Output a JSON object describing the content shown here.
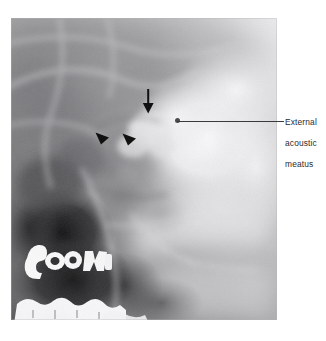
{
  "figure": {
    "type": "radiograph",
    "modality": "plain film radiograph of the skull (lateral oblique / temporal bone view)",
    "panel": {
      "name": "radiograph-image",
      "x": 11,
      "y": 18,
      "width": 266,
      "height": 302
    }
  },
  "labels": {
    "external_acoustic_meatus": {
      "line1": "External",
      "line2": "acoustic",
      "line3": "meatus",
      "full_text": "External acoustic meatus",
      "color": "#2b2b2e"
    }
  },
  "markers": [
    {
      "id": "arrow-down",
      "glyph": "arrow-down-icon",
      "shape": "downward solid arrow",
      "color": "#111111",
      "x": 147,
      "y": 101
    },
    {
      "id": "arrowhead-1",
      "glyph": "arrowhead-icon",
      "shape": "solid triangular arrowhead pointing right",
      "color": "#111111",
      "x": 102,
      "y": 138
    },
    {
      "id": "arrowhead-2",
      "glyph": "arrowhead-icon",
      "shape": "solid triangular arrowhead pointing right",
      "color": "#111111",
      "x": 129,
      "y": 139
    }
  ],
  "leader_line": {
    "name": "leader-line-external-acoustic-meatus",
    "from_x": 177,
    "from_y": 121,
    "to_x": 284,
    "to_y": 121,
    "color": "#3a3a3e"
  },
  "caption": {
    "text": "",
    "note": "cropped at page edge"
  },
  "colors": {
    "page_background": "#ffffff",
    "film_mid_gray": "#8e8e8e",
    "film_dense_bright": "#f2f2f2",
    "film_air_dark": "#1a1a1a",
    "marker_black": "#111111",
    "label_text": "#2b2b2e"
  }
}
